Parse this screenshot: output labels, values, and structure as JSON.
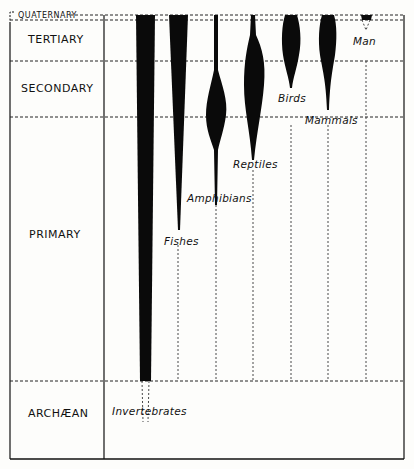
{
  "eras": [
    {
      "key": "quaternary",
      "label": "QUATERNARY"
    },
    {
      "key": "tertiary",
      "label": "TERTIARY"
    },
    {
      "key": "secondary",
      "label": "SECONDARY"
    },
    {
      "key": "primary",
      "label": "PRIMARY"
    },
    {
      "key": "archaean",
      "label": "ARCHÆAN"
    }
  ],
  "groups": [
    {
      "key": "invertebrates",
      "label": "Invertebrates"
    },
    {
      "key": "fishes",
      "label": "Fishes"
    },
    {
      "key": "amphibians",
      "label": "Amphibians"
    },
    {
      "key": "reptiles",
      "label": "Reptiles"
    },
    {
      "key": "birds",
      "label": "Birds"
    },
    {
      "key": "mammals",
      "label": "Mammals"
    },
    {
      "key": "man",
      "label": "Man"
    }
  ],
  "colors": {
    "ink": "#111111",
    "paper": "#fdfdfb"
  }
}
